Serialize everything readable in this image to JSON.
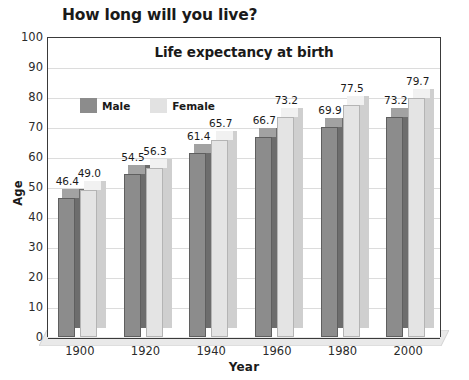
{
  "headline": "How long will you live?",
  "chart_data": {
    "type": "bar",
    "title": "Life expectancy at birth",
    "xlabel": "Year",
    "ylabel": "Age",
    "ylim": [
      0,
      100
    ],
    "ytick_step": 10,
    "yticks": [
      "100",
      "90",
      "80",
      "70",
      "60",
      "50",
      "40",
      "30",
      "20",
      "10",
      "0"
    ],
    "grid": true,
    "legend_position": "top-left-inside",
    "categories": [
      "1900",
      "1920",
      "1940",
      "1960",
      "1980",
      "2000"
    ],
    "series": [
      {
        "name": "Male",
        "color": "#8c8c8c",
        "values": [
          46.4,
          54.5,
          61.4,
          66.7,
          69.9,
          73.2
        ],
        "labels": [
          "46.4",
          "54.5",
          "61.4",
          "66.7",
          "69.9",
          "73.2"
        ]
      },
      {
        "name": "Female",
        "color": "#e4e4e4",
        "values": [
          49.0,
          56.3,
          65.7,
          73.2,
          77.5,
          79.7
        ],
        "labels": [
          "49.0",
          "56.3",
          "65.7",
          "73.2",
          "77.5",
          "79.7"
        ]
      }
    ]
  },
  "colors": {
    "male": "#8c8c8c",
    "female": "#e4e4e4",
    "male_side": "#6d6d6d",
    "female_side": "#cfcfcf",
    "male_top": "#a2a2a2",
    "female_top": "#f1f1f1",
    "axis": "#3a3a3a",
    "grid": "#dcdcdc",
    "floor": "#e9e9e9"
  }
}
